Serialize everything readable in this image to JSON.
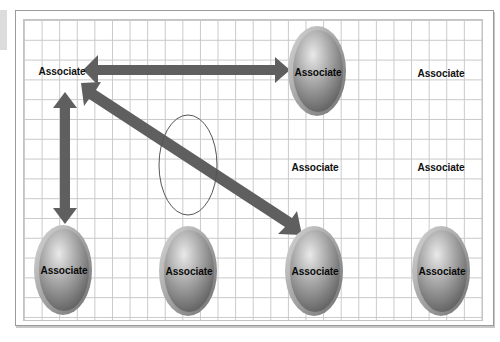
{
  "diagram": {
    "title": "",
    "colors": {
      "grid_line": "#c9c9c9",
      "frame_border": "#9a9a9a",
      "arrow_fill": "#5f5f5f",
      "oval_light": "#e6e6e6",
      "oval_dark": "#6e6e6e",
      "oval_rim": "#b8b8b8",
      "outline_ellipse": "#555555",
      "text": "#111111"
    },
    "nodes": [
      {
        "id": "n1",
        "label": "Associate",
        "shape": "text",
        "cx": 62,
        "cy": 71
      },
      {
        "id": "n2",
        "label": "Associate",
        "shape": "oval",
        "cx": 317,
        "cy": 71
      },
      {
        "id": "n3",
        "label": "Associate",
        "shape": "text",
        "cx": 441,
        "cy": 73
      },
      {
        "id": "n4",
        "label": "Associate",
        "shape": "text",
        "cx": 315,
        "cy": 167
      },
      {
        "id": "n5",
        "label": "Associate",
        "shape": "text",
        "cx": 441,
        "cy": 167
      },
      {
        "id": "n6",
        "label": "Associate",
        "shape": "oval",
        "cx": 63,
        "cy": 270
      },
      {
        "id": "n7",
        "label": "Associate",
        "shape": "oval",
        "cx": 188,
        "cy": 271
      },
      {
        "id": "n8",
        "label": "Associate",
        "shape": "oval",
        "cx": 314,
        "cy": 271
      },
      {
        "id": "n9",
        "label": "Associate",
        "shape": "oval",
        "cx": 441,
        "cy": 271
      }
    ],
    "edges": [
      {
        "from": "n1",
        "to": "n2",
        "type": "double-arrow",
        "direction": "horizontal"
      },
      {
        "from": "n1",
        "to": "n6",
        "type": "double-arrow",
        "direction": "vertical"
      },
      {
        "from": "n1",
        "to": "n8",
        "type": "double-arrow",
        "direction": "diagonal"
      }
    ],
    "annotations": [
      {
        "type": "outline-ellipse",
        "cx": 188,
        "cy": 165,
        "rx": 29,
        "ry": 50
      }
    ]
  }
}
